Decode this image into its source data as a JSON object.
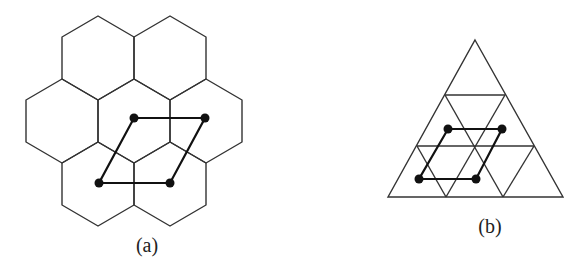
{
  "figure": {
    "panels": [
      {
        "id": "a",
        "label": "(a)",
        "description": "hexagonal tiling of seven cells with a rhombus connecting four cell centers",
        "hexagons": [
          [
            98,
            16,
            134,
            37,
            134,
            79,
            98,
            100,
            62,
            79,
            62,
            37
          ],
          [
            170,
            16,
            206,
            37,
            206,
            79,
            170,
            100,
            134,
            79,
            134,
            37
          ],
          [
            62,
            79,
            98,
            100,
            98,
            142,
            62,
            163,
            26,
            142,
            26,
            100
          ],
          [
            134,
            79,
            170,
            100,
            170,
            142,
            134,
            163,
            98,
            142,
            98,
            100
          ],
          [
            206,
            79,
            242,
            100,
            242,
            142,
            206,
            163,
            170,
            142,
            170,
            100
          ],
          [
            98,
            142,
            134,
            163,
            134,
            205,
            98,
            226,
            62,
            205,
            62,
            163
          ],
          [
            170,
            142,
            206,
            163,
            206,
            205,
            170,
            226,
            134,
            205,
            134,
            163
          ]
        ],
        "rhombus": [
          [
            134,
            118
          ],
          [
            205,
            118
          ],
          [
            170,
            183
          ],
          [
            99,
            183
          ]
        ],
        "dots": [
          [
            134,
            118
          ],
          [
            205,
            118
          ],
          [
            99,
            183
          ],
          [
            170,
            183
          ]
        ],
        "label_pos": [
          147,
          245
        ]
      },
      {
        "id": "b",
        "label": "(b)",
        "description": "triangle subdivided into triangular grid with a rhombus connecting four points",
        "outer_triangle": [
          [
            475,
            40
          ],
          [
            563,
            197
          ],
          [
            388,
            197
          ]
        ],
        "lines": [
          [
            [
              445,
              95
            ],
            [
              505,
              95
            ]
          ],
          [
            [
              417,
              146
            ],
            [
              534,
              146
            ]
          ],
          [
            [
              445,
              95
            ],
            [
              503,
              197
            ]
          ],
          [
            [
              505,
              95
            ],
            [
              446,
              197
            ]
          ],
          [
            [
              417,
              146
            ],
            [
              446,
              197
            ]
          ],
          [
            [
              534,
              146
            ],
            [
              503,
              197
            ]
          ]
        ],
        "rhombus": [
          [
            448,
            129
          ],
          [
            502,
            129
          ],
          [
            476,
            179
          ],
          [
            419,
            179
          ]
        ],
        "dots": [
          [
            448,
            129
          ],
          [
            502,
            129
          ],
          [
            419,
            179
          ],
          [
            476,
            179
          ]
        ],
        "label_pos": [
          490,
          226
        ]
      }
    ],
    "colors": {
      "grid_line": "#333333",
      "rhombus_line": "#111111",
      "dot": "#111111",
      "background": "#ffffff"
    }
  }
}
